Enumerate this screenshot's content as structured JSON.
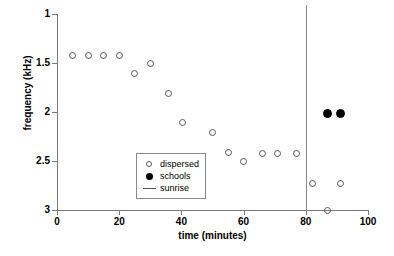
{
  "chart_data": {
    "type": "scatter",
    "title": "",
    "xlabel": "time (minutes)",
    "ylabel": "frequency (kHz)",
    "xlim": [
      0,
      100
    ],
    "ylim": [
      3,
      1
    ],
    "y_axis_inverted": true,
    "grid": false,
    "xticks": [
      0,
      20,
      40,
      60,
      80,
      100
    ],
    "xticklabels": [
      "0",
      "20",
      "40",
      "60",
      "80",
      "100"
    ],
    "yticks": [
      1,
      1.5,
      2,
      2.5,
      3
    ],
    "yticklabels": [
      "1",
      "1.5",
      "2",
      "2.5",
      "3"
    ],
    "legend_position": "lower left",
    "legend": [
      {
        "label": "dispersed",
        "marker": "open-circle"
      },
      {
        "label": "schools",
        "marker": "filled-circle"
      },
      {
        "label": "sunrise",
        "marker": "line"
      }
    ],
    "annotations": [
      {
        "name": "sunrise",
        "type": "vline",
        "x": 80
      }
    ],
    "series": [
      {
        "name": "dispersed",
        "marker": "open-circle",
        "color": "#5a5a5a",
        "points": [
          {
            "x": 5,
            "y": 1.42
          },
          {
            "x": 10,
            "y": 1.42
          },
          {
            "x": 15,
            "y": 1.42
          },
          {
            "x": 20,
            "y": 1.42
          },
          {
            "x": 25,
            "y": 1.61
          },
          {
            "x": 30,
            "y": 1.51
          },
          {
            "x": 36,
            "y": 1.81
          },
          {
            "x": 40.5,
            "y": 2.11
          },
          {
            "x": 50,
            "y": 2.21
          },
          {
            "x": 55,
            "y": 2.41
          },
          {
            "x": 60,
            "y": 2.51
          },
          {
            "x": 66,
            "y": 2.42
          },
          {
            "x": 71,
            "y": 2.42
          },
          {
            "x": 77,
            "y": 2.42
          },
          {
            "x": 82,
            "y": 2.73
          },
          {
            "x": 87,
            "y": 3.0
          },
          {
            "x": 91,
            "y": 2.73
          }
        ]
      },
      {
        "name": "schools",
        "marker": "filled-circle",
        "color": "#000000",
        "points": [
          {
            "x": 87,
            "y": 2.02
          },
          {
            "x": 91,
            "y": 2.02
          }
        ]
      }
    ]
  }
}
